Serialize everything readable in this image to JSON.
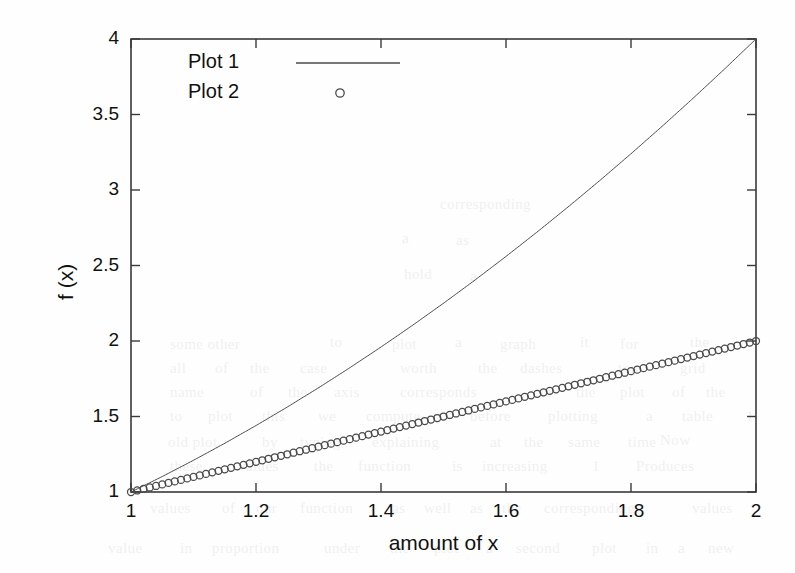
{
  "figure": {
    "background_color": "#fefefe",
    "axis_color": "#3a3a3a",
    "series_color": "#4a4a4a"
  },
  "chart_data": {
    "type": "line",
    "title": "",
    "subtitle": "",
    "xlabel": "amount of x",
    "ylabel": "f (x)",
    "xlim": [
      1,
      2
    ],
    "ylim": [
      1,
      4
    ],
    "xticks": [
      1,
      1.2,
      1.4,
      1.6,
      1.8,
      2
    ],
    "xtick_labels": [
      "1",
      "1.2",
      "1.4",
      "1.6",
      "1.8",
      "2"
    ],
    "yticks": [
      1,
      1.5,
      2,
      2.5,
      3,
      3.5,
      4
    ],
    "ytick_labels": [
      "1",
      "1.5",
      "2",
      "2.5",
      "3",
      "3.5",
      "4"
    ],
    "grid": false,
    "box": true,
    "tick_direction": "in",
    "ticks_all_sides": true,
    "legend_position": "upper left",
    "legend_border": false,
    "series": [
      {
        "name": "Plot 1",
        "style": "line",
        "marker": "none",
        "linewidth": 1,
        "formula": "f(x) = x^2",
        "x": [
          1,
          1.05,
          1.1,
          1.15,
          1.2,
          1.25,
          1.3,
          1.35,
          1.4,
          1.45,
          1.5,
          1.55,
          1.6,
          1.65,
          1.7,
          1.75,
          1.8,
          1.85,
          1.9,
          1.95,
          2
        ],
        "values": [
          1,
          1.1025,
          1.21,
          1.3225,
          1.44,
          1.5625,
          1.69,
          1.8225,
          1.96,
          2.1025,
          2.25,
          2.4025,
          2.56,
          2.7225,
          2.89,
          3.0625,
          3.24,
          3.4225,
          3.61,
          3.8025,
          4
        ]
      },
      {
        "name": "Plot 2",
        "style": "markers",
        "marker": "circle",
        "marker_size": 7,
        "marker_count": 101,
        "formula": "f(x) = x",
        "x": [
          1,
          1.05,
          1.1,
          1.15,
          1.2,
          1.25,
          1.3,
          1.35,
          1.4,
          1.45,
          1.5,
          1.55,
          1.6,
          1.65,
          1.7,
          1.75,
          1.8,
          1.85,
          1.9,
          1.95,
          2
        ],
        "values": [
          1,
          1.05,
          1.1,
          1.15,
          1.2,
          1.25,
          1.3,
          1.35,
          1.4,
          1.45,
          1.5,
          1.55,
          1.6,
          1.65,
          1.7,
          1.75,
          1.8,
          1.85,
          1.9,
          1.95,
          2
        ]
      }
    ]
  },
  "legend": {
    "entries": [
      {
        "label": "Plot 1",
        "sample": "line"
      },
      {
        "label": "Plot 2",
        "sample": "circle"
      }
    ]
  },
  "background_bleed": [
    {
      "text": "corresponding",
      "x": 440,
      "y": 196
    },
    {
      "text": "a",
      "x": 402,
      "y": 230
    },
    {
      "text": "as",
      "x": 456,
      "y": 232
    },
    {
      "text": "hold",
      "x": 404,
      "y": 266
    },
    {
      "text": "a",
      "x": 470,
      "y": 268
    },
    {
      "text": "some other",
      "x": 170,
      "y": 336
    },
    {
      "text": "to",
      "x": 330,
      "y": 334
    },
    {
      "text": "plot",
      "x": 392,
      "y": 336
    },
    {
      "text": "a",
      "x": 455,
      "y": 334
    },
    {
      "text": "graph",
      "x": 500,
      "y": 336
    },
    {
      "text": "it",
      "x": 580,
      "y": 334
    },
    {
      "text": "for",
      "x": 620,
      "y": 336
    },
    {
      "text": "the",
      "x": 690,
      "y": 334
    },
    {
      "text": "all",
      "x": 170,
      "y": 360
    },
    {
      "text": "of",
      "x": 215,
      "y": 360
    },
    {
      "text": "the",
      "x": 250,
      "y": 360
    },
    {
      "text": "case",
      "x": 300,
      "y": 360
    },
    {
      "text": "worth",
      "x": 400,
      "y": 360
    },
    {
      "text": "the",
      "x": 478,
      "y": 360
    },
    {
      "text": "dashes",
      "x": 520,
      "y": 360
    },
    {
      "text": "top",
      "x": 618,
      "y": 360
    },
    {
      "text": "grid",
      "x": 680,
      "y": 360
    },
    {
      "text": "name",
      "x": 170,
      "y": 384
    },
    {
      "text": "of",
      "x": 250,
      "y": 384
    },
    {
      "text": "the",
      "x": 288,
      "y": 384
    },
    {
      "text": "axis",
      "x": 334,
      "y": 384
    },
    {
      "text": "corresponds",
      "x": 400,
      "y": 384
    },
    {
      "text": "to",
      "x": 540,
      "y": 384
    },
    {
      "text": "the",
      "x": 576,
      "y": 384
    },
    {
      "text": "plot",
      "x": 620,
      "y": 384
    },
    {
      "text": "of",
      "x": 672,
      "y": 384
    },
    {
      "text": "the",
      "x": 706,
      "y": 384
    },
    {
      "text": "to",
      "x": 170,
      "y": 408
    },
    {
      "text": "plot",
      "x": 208,
      "y": 408
    },
    {
      "text": "this",
      "x": 262,
      "y": 408
    },
    {
      "text": "we",
      "x": 318,
      "y": 408
    },
    {
      "text": "compute",
      "x": 366,
      "y": 408
    },
    {
      "text": "before",
      "x": 470,
      "y": 408
    },
    {
      "text": "plotting",
      "x": 548,
      "y": 408
    },
    {
      "text": "a",
      "x": 646,
      "y": 408
    },
    {
      "text": "table",
      "x": 682,
      "y": 408
    },
    {
      "text": "1",
      "x": 746,
      "y": 408
    },
    {
      "text": "Now",
      "x": 660,
      "y": 432
    },
    {
      "text": "old plot",
      "x": 168,
      "y": 434
    },
    {
      "text": "by",
      "x": 262,
      "y": 434
    },
    {
      "text": "typing",
      "x": 300,
      "y": 434
    },
    {
      "text": "explaining",
      "x": 372,
      "y": 434
    },
    {
      "text": "at",
      "x": 490,
      "y": 434
    },
    {
      "text": "the",
      "x": 524,
      "y": 434
    },
    {
      "text": "same",
      "x": 568,
      "y": 434
    },
    {
      "text": "time",
      "x": 628,
      "y": 434
    },
    {
      "text": "these",
      "x": 170,
      "y": 458
    },
    {
      "text": "values",
      "x": 238,
      "y": 458
    },
    {
      "text": "the",
      "x": 314,
      "y": 458
    },
    {
      "text": "function",
      "x": 358,
      "y": 458
    },
    {
      "text": "is",
      "x": 452,
      "y": 458
    },
    {
      "text": "increasing",
      "x": 482,
      "y": 458
    },
    {
      "text": "1",
      "x": 592,
      "y": 458
    },
    {
      "text": "Produces",
      "x": 636,
      "y": 458
    },
    {
      "text": "values",
      "x": 150,
      "y": 500
    },
    {
      "text": "of",
      "x": 222,
      "y": 500
    },
    {
      "text": "our",
      "x": 256,
      "y": 500
    },
    {
      "text": "function",
      "x": 300,
      "y": 500
    },
    {
      "text": "as",
      "x": 392,
      "y": 500
    },
    {
      "text": "well",
      "x": 424,
      "y": 500
    },
    {
      "text": "as",
      "x": 470,
      "y": 500
    },
    {
      "text": "the",
      "x": 502,
      "y": 500
    },
    {
      "text": "corresponding",
      "x": 544,
      "y": 500
    },
    {
      "text": "values",
      "x": 692,
      "y": 500
    },
    {
      "text": "value",
      "x": 108,
      "y": 540
    },
    {
      "text": "in",
      "x": 180,
      "y": 540
    },
    {
      "text": "proportion",
      "x": 212,
      "y": 540
    },
    {
      "text": "under",
      "x": 324,
      "y": 540
    },
    {
      "text": "the",
      "x": 390,
      "y": 540
    },
    {
      "text": "plot",
      "x": 434,
      "y": 540
    },
    {
      "text": "a",
      "x": 486,
      "y": 540
    },
    {
      "text": "second",
      "x": 516,
      "y": 540
    },
    {
      "text": "plot",
      "x": 592,
      "y": 540
    },
    {
      "text": "in",
      "x": 646,
      "y": 540
    },
    {
      "text": "a",
      "x": 678,
      "y": 540
    },
    {
      "text": "new",
      "x": 708,
      "y": 540
    }
  ]
}
